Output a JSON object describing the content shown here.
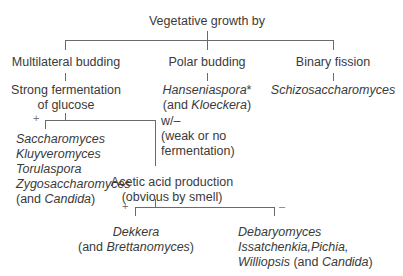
{
  "root": {
    "label": "Vegetative growth by"
  },
  "branches": {
    "multilateral": {
      "label": "Multilateral budding",
      "child_line1": "Strong fermentation",
      "child_line2": "of glucose"
    },
    "polar": {
      "label": "Polar budding",
      "genus": "Hanseniaspora",
      "genus_mark": "*",
      "alt_prefix": "(and ",
      "alt_genus": "Kloeckera",
      "alt_suffix": ")"
    },
    "binary": {
      "label": "Binary fission",
      "genus": "Schizosaccharomyces"
    }
  },
  "fermentation": {
    "plus_symbol": "+",
    "plus_genera": [
      "Saccharomyces",
      "Kluyveromyces",
      "Torulaspora",
      "Zygosaccharomyces"
    ],
    "plus_alt_prefix": "(and ",
    "plus_alt_genus": "Candida",
    "plus_alt_suffix": ")",
    "minus_label_line1": "w/–",
    "minus_label_line2": "(weak or no",
    "minus_label_line3": "fermentation)"
  },
  "acetic": {
    "label_line1": "Acetic acid production",
    "label_line2": "(obvious by smell)",
    "plus_symbol": "+",
    "minus_symbol": "–",
    "plus_genus": "Dekkera",
    "plus_alt_prefix": "(and ",
    "plus_alt_genus": "Brettanomyces",
    "plus_alt_suffix": ")",
    "minus_genera_line1": "Debaryomyces",
    "minus_genera_line2": "Issatchenkia,Pichia,",
    "minus_genera_line3_genus": "Williopsis",
    "minus_genera_line3_prefix": " (and ",
    "minus_genera_line3_alt": "Candida",
    "minus_genera_line3_suffix": ")"
  }
}
